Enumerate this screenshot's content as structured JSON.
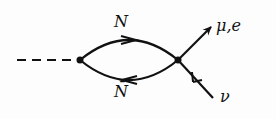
{
  "diagram": {
    "type": "feynman-diagram",
    "labels": {
      "upper_line": "N",
      "lower_line": "N̄",
      "outgoing_lepton": "μ,e",
      "incoming_neutrino": "ν"
    },
    "colors": {
      "ink": "#111111",
      "background": "#fdfdfd"
    }
  }
}
